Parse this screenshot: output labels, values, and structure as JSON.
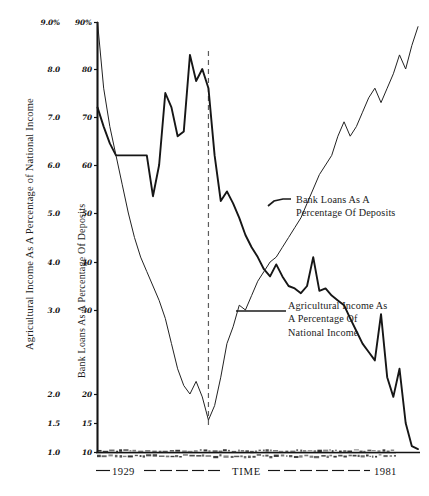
{
  "figure": {
    "caption": "",
    "background": "#ffffff",
    "ink": "#1a1a1a"
  },
  "axes": {
    "left_title": "Agricultural Income As A Percentage of National Income",
    "inner_title": "Bank Loans As A Percentage Of Deposits",
    "x_start_label": "1929",
    "x_axis_label": "TIME",
    "x_end_label": "1981",
    "left_ticks": [
      "9.0%",
      "8.0",
      "7.0",
      "6.0",
      "5.0",
      "4.0",
      "3.0",
      "2.0",
      "1.5",
      "1.0"
    ],
    "right_ticks": [
      "90%",
      "80",
      "70",
      "60",
      "50",
      "40",
      "30",
      "20",
      "15",
      "10"
    ]
  },
  "annotations": {
    "bank": [
      "Bank Loans As A",
      "Percentage Of Deposits"
    ],
    "agricultural": [
      "Agricultural Income As",
      "A Percentage Of",
      "National Income"
    ]
  },
  "chart_data": {
    "type": "line",
    "title": "",
    "subtitle": "",
    "xlabel": "TIME",
    "ylabel": "Agricultural Income As A Percentage of National Income",
    "ylabel_secondary": "Bank Loans As A Percentage Of Deposits",
    "xlim": [
      1929,
      1981
    ],
    "xticks": [
      1929,
      1981
    ],
    "xticklabels": [
      "1929",
      "1981"
    ],
    "ylim": [
      1.0,
      9.0
    ],
    "yticks": [
      1.0,
      1.5,
      2.0,
      3.0,
      4.0,
      5.0,
      6.0,
      7.0,
      8.0,
      9.0
    ],
    "yticklabels": [
      "1.0",
      "1.5",
      "2.0",
      "3.0",
      "4.0",
      "5.0",
      "6.0",
      "7.0",
      "8.0",
      "9.0%"
    ],
    "ylim_secondary": [
      10,
      90
    ],
    "yticks_secondary": [
      10,
      15,
      20,
      30,
      40,
      50,
      60,
      70,
      80,
      90
    ],
    "yticklabels_secondary": [
      "10",
      "15",
      "20",
      "30",
      "40",
      "50",
      "60",
      "70",
      "80",
      "90%"
    ],
    "yscale_note": "non-linear: 1.0-2.0 region compressed at base",
    "grid": false,
    "legend": "inline annotations with leader lines",
    "vertical_marker": {
      "label": "",
      "x": 1947,
      "style": "dashed",
      "note": "marks agricultural income peak / bank loans trough"
    },
    "series": [
      {
        "name": "Agricultural Income As A Percentage Of National Income",
        "axis": "left",
        "units": "percent of national income",
        "stroke": "#161616",
        "width": 1.9,
        "x": [
          1929,
          1930,
          1931,
          1932,
          1933,
          1934,
          1935,
          1936,
          1937,
          1938,
          1939,
          1940,
          1941,
          1942,
          1943,
          1944,
          1945,
          1946,
          1947,
          1948,
          1949,
          1950,
          1951,
          1952,
          1953,
          1954,
          1955,
          1956,
          1957,
          1958,
          1959,
          1960,
          1961,
          1962,
          1963,
          1964,
          1965,
          1966,
          1967,
          1968,
          1969,
          1970,
          1971,
          1972,
          1973,
          1974,
          1975,
          1976,
          1977,
          1978,
          1979,
          1980,
          1981
        ],
        "y": [
          7.2,
          6.8,
          6.45,
          6.2,
          6.2,
          6.2,
          6.2,
          6.2,
          6.2,
          5.35,
          6.0,
          7.5,
          7.2,
          6.6,
          6.7,
          8.3,
          7.75,
          8.0,
          7.6,
          6.2,
          5.25,
          5.45,
          5.2,
          4.9,
          4.55,
          4.3,
          4.1,
          3.85,
          3.7,
          3.95,
          3.7,
          3.5,
          3.45,
          3.35,
          3.5,
          4.1,
          3.4,
          3.45,
          3.3,
          3.2,
          3.1,
          2.9,
          2.75,
          2.6,
          2.5,
          2.4,
          2.95,
          2.2,
          1.95,
          2.3,
          1.5,
          1.1,
          1.05
        ]
      },
      {
        "name": "Bank Loans As A Percentage Of Deposits",
        "axis": "right",
        "units": "percent of deposits",
        "stroke": "#222222",
        "width": 1.0,
        "x": [
          1929,
          1930,
          1931,
          1932,
          1933,
          1934,
          1935,
          1936,
          1937,
          1938,
          1939,
          1940,
          1941,
          1942,
          1943,
          1944,
          1945,
          1946,
          1947,
          1948,
          1949,
          1950,
          1951,
          1952,
          1953,
          1954,
          1955,
          1956,
          1957,
          1958,
          1959,
          1960,
          1961,
          1962,
          1963,
          1964,
          1965,
          1966,
          1967,
          1968,
          1969,
          1970,
          1971,
          1972,
          1973,
          1974,
          1975,
          1976,
          1977,
          1978,
          1979,
          1980,
          1981
        ],
        "y": [
          90,
          76,
          68,
          62,
          56,
          50,
          45,
          41,
          38,
          35,
          32,
          29,
          26,
          23,
          21,
          20,
          21.5,
          19.5,
          15.5,
          18,
          22,
          26,
          28,
          31,
          30,
          33,
          36,
          38,
          40,
          41,
          43,
          45,
          47,
          49,
          52,
          55,
          58,
          60,
          62,
          66,
          69,
          66,
          68,
          71,
          74,
          76,
          73,
          76,
          79,
          83,
          80,
          85,
          89
        ]
      }
    ]
  }
}
